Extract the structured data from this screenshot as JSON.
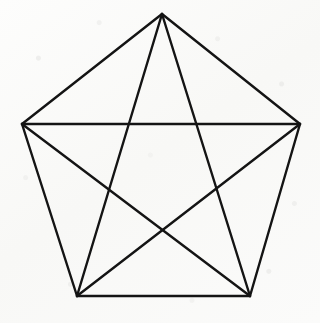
{
  "figure": {
    "name": "pentagram-in-pentagon",
    "shape_type": "line-drawing",
    "ink_color": "#141414",
    "paper_color": "#fcfcfb",
    "stroke_width": 2.4,
    "canvas": {
      "width": 320,
      "height": 323
    },
    "vertices": [
      {
        "id": "A",
        "label": "top",
        "x": 162,
        "y": 14
      },
      {
        "id": "B",
        "label": "right",
        "x": 300,
        "y": 124
      },
      {
        "id": "C",
        "label": "bottom-right",
        "x": 250,
        "y": 296
      },
      {
        "id": "D",
        "label": "bottom-left",
        "x": 77,
        "y": 296
      },
      {
        "id": "E",
        "label": "left",
        "x": 22,
        "y": 124
      }
    ],
    "pentagon_edges": [
      {
        "name": "edge-A-B",
        "from": "A",
        "to": "B",
        "x1": 162,
        "y1": 14,
        "x2": 300,
        "y2": 124
      },
      {
        "name": "edge-B-C",
        "from": "B",
        "to": "C",
        "x1": 300,
        "y1": 124,
        "x2": 250,
        "y2": 296
      },
      {
        "name": "edge-C-D",
        "from": "C",
        "to": "D",
        "x1": 250,
        "y1": 296,
        "x2": 77,
        "y2": 296
      },
      {
        "name": "edge-D-E",
        "from": "D",
        "to": "E",
        "x1": 77,
        "y1": 296,
        "x2": 22,
        "y2": 124
      },
      {
        "name": "edge-E-A",
        "from": "E",
        "to": "A",
        "x1": 22,
        "y1": 124,
        "x2": 162,
        "y2": 14
      }
    ],
    "diagonal_edges": [
      {
        "name": "diagonal-A-C",
        "from": "A",
        "to": "C",
        "x1": 162,
        "y1": 14,
        "x2": 250,
        "y2": 296
      },
      {
        "name": "diagonal-A-D",
        "from": "A",
        "to": "D",
        "x1": 162,
        "y1": 14,
        "x2": 77,
        "y2": 296
      },
      {
        "name": "diagonal-B-D",
        "from": "B",
        "to": "D",
        "x1": 300,
        "y1": 124,
        "x2": 77,
        "y2": 296
      },
      {
        "name": "diagonal-B-E",
        "from": "B",
        "to": "E",
        "x1": 300,
        "y1": 124,
        "x2": 22,
        "y2": 124
      },
      {
        "name": "diagonal-C-E",
        "from": "C",
        "to": "E",
        "x1": 250,
        "y1": 296,
        "x2": 22,
        "y2": 124
      }
    ],
    "edge_count": 10,
    "vertex_count": 5
  }
}
